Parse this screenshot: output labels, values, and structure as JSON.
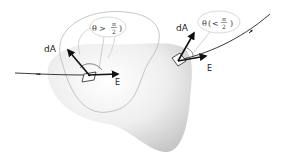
{
  "diagram": {
    "type": "electric-flux-closed-surface",
    "left_element": {
      "area_vector_label": "dA",
      "field_label": "E",
      "angle_annotation": {
        "symbol": "θ",
        "relation": ">",
        "numerator": "π",
        "denominator": "2"
      }
    },
    "right_element": {
      "area_vector_label": "dA",
      "field_label": "E",
      "angle_annotation": {
        "symbol": "θ",
        "relation": "<",
        "numerator": "π",
        "denominator": "2"
      }
    },
    "colors": {
      "surface_fill_light": "#fafafa",
      "surface_fill_dark": "#cfcfcf",
      "vector_color": "#111111",
      "callout_color": "#aaaaaa"
    }
  }
}
